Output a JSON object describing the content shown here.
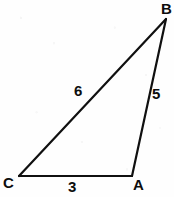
{
  "figure": {
    "name": "labeled-triangle",
    "stroke_color": "#101010",
    "background_color": "#fefefe",
    "stroke_width": 2.2,
    "canvas": {
      "width": 174,
      "height": 197
    },
    "vertices": [
      {
        "id": "B",
        "label": "B",
        "x": 166,
        "y": 19,
        "label_x": 161,
        "label_y": 1,
        "position": "top-right"
      },
      {
        "id": "C",
        "label": "C",
        "x": 19,
        "y": 176,
        "label_x": 3,
        "label_y": 175,
        "position": "bottom-left"
      },
      {
        "id": "A",
        "label": "A",
        "x": 132,
        "y": 176,
        "label_x": 133,
        "label_y": 177,
        "position": "bottom-right"
      }
    ],
    "edges": [
      {
        "id": "CB",
        "from": "C",
        "to": "B",
        "length_label": "6",
        "label_x": 74,
        "label_y": 83
      },
      {
        "id": "AB",
        "from": "A",
        "to": "B",
        "length_label": "5",
        "label_x": 152,
        "label_y": 86
      },
      {
        "id": "CA",
        "from": "C",
        "to": "A",
        "length_label": "3",
        "label_x": 68,
        "label_y": 179
      }
    ],
    "side_lengths": {
      "CB": 6,
      "AB": 5,
      "CA": 3
    }
  }
}
